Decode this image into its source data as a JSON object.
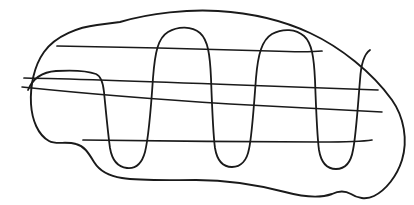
{
  "document": {
    "kind": "line-drawing",
    "title": "Hand-drawn closed blob outline with serpentine infill",
    "background_color": "#ffffff",
    "ink_color": "#1a1a1a",
    "canvas": {
      "width": 414,
      "height": 205
    },
    "stroke_weight_px": 1.8,
    "style": "single-weight freehand pen line, no shading, no text"
  },
  "strokes": {
    "outline": {
      "name": "blob-outline",
      "description": "Irregular closed contour, wide at left and tapering to a point at lower right",
      "path": "M 120 22 C 150 13 190 9 218 11 C 252 13 282 20 310 33 C 340 47 372 72 392 100 C 404 117 408 140 402 160 C 397 176 386 190 374 196 C 366 200 357 198 351 194 C 344 190 338 191 332 194 C 318 199 300 196 285 192 C 258 185 226 180 196 180 C 168 180 141 181 122 178 C 108 176 99 170 94 162 C 88 152 84 146 76 144 C 66 141 56 145 49 141 C 38 135 32 120 31 104 C 30 86 34 66 44 52 C 56 35 80 27 97 25 Z"
    },
    "serpentine": {
      "name": "serpentine-infill",
      "description": "Continuous boustrophedon zigzag of four tall narrow U/arch lobes sweeping left to right across the blob",
      "path": "M 28 90 C 33 78 42 72 56 71 C 72 70 88 71 96 74 C 101 76 103 82 104 92 C 106 112 108 134 110 148 C 112 160 118 167 127 168 C 136 169 142 163 145 152 C 148 140 151 108 153 78 C 155 52 158 38 168 32 C 178 26 192 26 200 33 C 208 40 210 55 211 78 C 212 106 213 134 215 148 C 217 160 223 167 232 167 C 241 167 247 160 249 149 C 252 136 254 104 256 78 C 258 54 262 40 272 34 C 283 28 296 29 304 36 C 312 43 314 58 315 80 C 316 108 317 136 319 150 C 321 162 327 169 336 169 C 345 169 351 162 353 150 C 356 136 358 104 360 80 C 361 64 364 54 370 50"
    },
    "horizontal_lines": [
      {
        "name": "horizontal-line-1",
        "description": "Upper long line from left-of-center up to the right shoulder of the outline",
        "path": "M 57 46 C 120 47 210 49 270 51 C 295 52 312 52 322 51"
      },
      {
        "name": "horizontal-line-2",
        "description": "Second long line across the full width, slightly sloping down to the right",
        "path": "M 24 78 C 80 79 160 82 240 85 C 300 87 350 89 378 90"
      },
      {
        "name": "horizontal-line-3",
        "description": "Third long line, lowest of the long sweeps, reaching toward the right tip",
        "path": "M 22 87 C 70 92 150 99 230 104 C 300 108 355 111 382 112"
      },
      {
        "name": "horizontal-line-4",
        "description": "Short lower line spanning the belly between the second and fourth lobes",
        "path": "M 83 140 C 150 141 250 142 320 142 C 350 142 366 141 372 140"
      }
    ]
  }
}
